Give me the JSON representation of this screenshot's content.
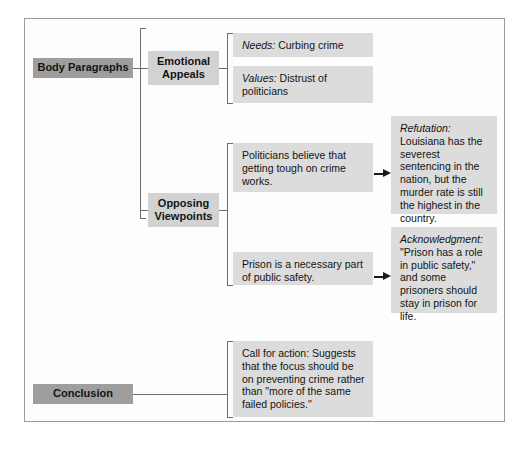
{
  "diagram": {
    "colors": {
      "level1_box": "#9e9e9e",
      "level2_box": "#d2d2d2",
      "level3_box": "#dcdcdc",
      "connector": "#6f6f6f",
      "arrow": "#1b1b1b",
      "page_border": "#9a9a9a"
    },
    "nodes": {
      "body_paragraphs": "Body Paragraphs",
      "conclusion": "Conclusion",
      "emotional_appeals_line1": "Emotional",
      "emotional_appeals_line2": "Appeals",
      "opposing_viewpoints_line1": "Opposing",
      "opposing_viewpoints_line2": "Viewpoints",
      "needs_term": "Needs:",
      "needs_text": " Curbing crime",
      "values_term": "Values:",
      "values_text": " Distrust of politicians",
      "politicians_claim": "Politicians believe that getting tough on crime works.",
      "prison_claim": "Prison is a necessary part of public safety.",
      "refutation_term": "Refutation:",
      "refutation_text": "Louisiana has the severest sentencing in the nation, but the murder rate is still the highest in the country.",
      "acknowledgment_term": "Acknowledgment:",
      "acknowledgment_text": "\"Prison has a role in public safety,\" and some prisoners should stay in prison for life.",
      "call_for_action": "Call for action: Suggests that the focus should be on preventing crime rather than \"more of the same failed policies.\""
    }
  }
}
